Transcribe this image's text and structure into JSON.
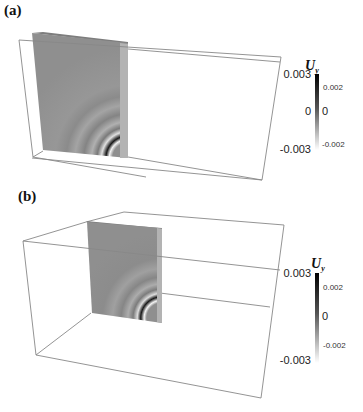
{
  "figure": {
    "panels": [
      {
        "label": "(a)",
        "colorbar": {
          "title": "U",
          "subscript": "y",
          "left_labels": [
            "0.003",
            "0",
            "-0.003"
          ],
          "right_labels": [
            "0.002",
            "0",
            "-0.002"
          ]
        }
      },
      {
        "label": "(b)",
        "colorbar": {
          "title": "U",
          "subscript": "y",
          "left_labels": [
            "0.003",
            "-0.003"
          ],
          "right_labels": [
            "0.002",
            "0",
            "-0.002"
          ]
        }
      }
    ]
  },
  "colors": {
    "slab": "#8f8f8f",
    "slab_side": "#b5b5b5",
    "box_edge": "#888888",
    "colorbar_top": "#000000",
    "colorbar_bottom": "#ffffff"
  }
}
